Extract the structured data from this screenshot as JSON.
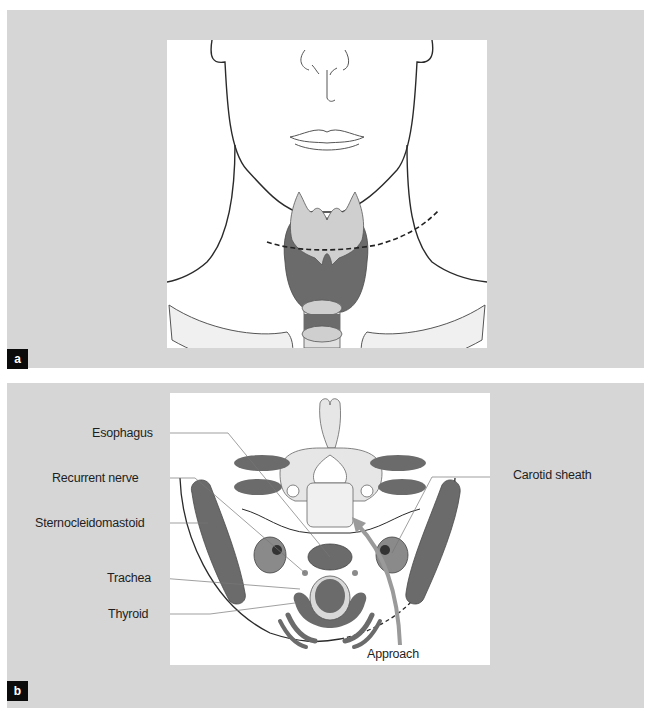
{
  "figure": {
    "panels": [
      {
        "letter": "a",
        "description": "Frontal view of lower face and neck showing thyroid and larynx with dashed incision line"
      },
      {
        "letter": "b",
        "description": "Axial cross-section of neck showing surgical approach",
        "labels": {
          "esophagus": "Esophagus",
          "recurrent_nerve": "Recurrent nerve",
          "sternocleidomastoid": "Sternocleidomastoid",
          "trachea": "Trachea",
          "thyroid": "Thyroid",
          "carotid_sheath": "Carotid sheath",
          "approach": "Approach"
        }
      }
    ],
    "colors": {
      "panel_background": "#d6d6d6",
      "art_background": "#ffffff",
      "dark_tissue": "#6b6b6b",
      "light_tissue": "#d9d9d9",
      "bone": "#e6e6e6",
      "outline": "#2a2a2a",
      "approach_arrow": "#9a9a9a",
      "letter_box": "#0b0b0b"
    }
  }
}
